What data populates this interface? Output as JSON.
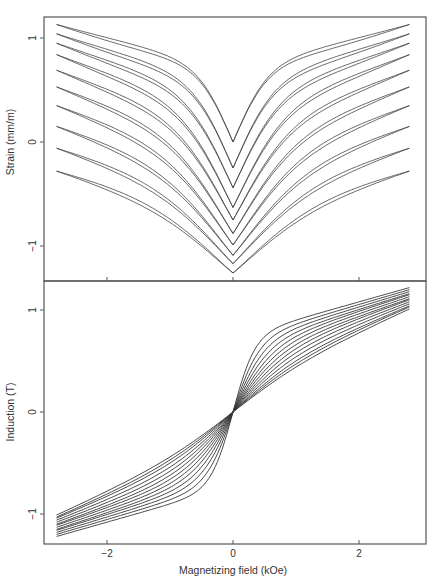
{
  "chart_data": [
    {
      "type": "line",
      "panel": "top",
      "title": "",
      "xlabel": "",
      "ylabel": "Strain (mm/m)",
      "xlim": [
        -3.0,
        3.05
      ],
      "ylim": [
        -1.34,
        1.2
      ],
      "yticks": [
        1,
        0,
        -1
      ],
      "ytick_labels": [
        "1",
        "0",
        "−1"
      ],
      "xticks": [
        -2,
        0,
        2
      ],
      "xtick_labels": [
        "",
        "",
        ""
      ],
      "grid": false,
      "legend": null,
      "x_range_data": [
        -2.8,
        2.8
      ],
      "series_description": "10 butterfly strain curves (each a narrow hysteresis pair), offset vertically",
      "series": [
        {
          "name": "curve 1",
          "min_at_zero": 0.0,
          "end_value": 1.13
        },
        {
          "name": "curve 2",
          "min_at_zero": -0.25,
          "end_value": 1.04
        },
        {
          "name": "curve 3",
          "min_at_zero": -0.44,
          "end_value": 0.95
        },
        {
          "name": "curve 4",
          "min_at_zero": -0.63,
          "end_value": 0.84
        },
        {
          "name": "curve 5",
          "min_at_zero": -0.75,
          "end_value": 0.69
        },
        {
          "name": "curve 6",
          "min_at_zero": -0.88,
          "end_value": 0.53
        },
        {
          "name": "curve 7",
          "min_at_zero": -0.99,
          "end_value": 0.35
        },
        {
          "name": "curve 8",
          "min_at_zero": -1.09,
          "end_value": 0.15
        },
        {
          "name": "curve 9",
          "min_at_zero": -1.17,
          "end_value": -0.06
        },
        {
          "name": "curve 10",
          "min_at_zero": -1.26,
          "end_value": -0.28
        }
      ]
    },
    {
      "type": "line",
      "panel": "bottom",
      "title": "",
      "xlabel": "Magnetizing field (kOe)",
      "ylabel": "Induction (T)",
      "xlim": [
        -3.0,
        3.05
      ],
      "ylim": [
        -1.3,
        1.3
      ],
      "yticks": [
        1,
        0,
        -1
      ],
      "ytick_labels": [
        "1",
        "0",
        "−1"
      ],
      "xticks": [
        -2,
        0,
        2
      ],
      "xtick_labels": [
        "−2",
        "0",
        "2"
      ],
      "grid": false,
      "legend": null,
      "x_range_data": [
        -2.8,
        2.8
      ],
      "series_description": "13 B-H magnetization curves through origin, antisymmetric",
      "series": [
        {
          "name": "curve 1",
          "B_at_max_field": 1.22,
          "B_at_1kOe": 0.9
        },
        {
          "name": "curve 2",
          "B_at_max_field": 1.2,
          "B_at_1kOe": 0.86
        },
        {
          "name": "curve 3",
          "B_at_max_field": 1.18,
          "B_at_1kOe": 0.82
        },
        {
          "name": "curve 4",
          "B_at_max_field": 1.16,
          "B_at_1kOe": 0.78
        },
        {
          "name": "curve 5",
          "B_at_max_field": 1.15,
          "B_at_1kOe": 0.74
        },
        {
          "name": "curve 6",
          "B_at_max_field": 1.13,
          "B_at_1kOe": 0.7
        },
        {
          "name": "curve 7",
          "B_at_max_field": 1.11,
          "B_at_1kOe": 0.66
        },
        {
          "name": "curve 8",
          "B_at_max_field": 1.1,
          "B_at_1kOe": 0.62
        },
        {
          "name": "curve 9",
          "B_at_max_field": 1.08,
          "B_at_1kOe": 0.58
        },
        {
          "name": "curve 10",
          "B_at_max_field": 1.06,
          "B_at_1kOe": 0.54
        },
        {
          "name": "curve 11",
          "B_at_max_field": 1.04,
          "B_at_1kOe": 0.5
        },
        {
          "name": "curve 12",
          "B_at_max_field": 1.03,
          "B_at_1kOe": 0.47
        },
        {
          "name": "curve 13",
          "B_at_max_field": 1.01,
          "B_at_1kOe": 0.44
        }
      ]
    }
  ],
  "layout": {
    "frame": {
      "left": 44,
      "right": 426,
      "top": 17,
      "mid": 281,
      "bottom": 544
    },
    "x_zero_px": 233,
    "x_px_per_unit": 63,
    "top_y_zero_px": 142,
    "top_y_px_per_unit": 104,
    "bottom_y_zero_px": 412,
    "bottom_y_px_per_unit": 102
  }
}
